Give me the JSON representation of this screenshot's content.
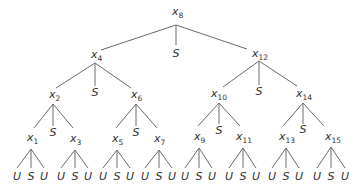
{
  "diagram": {
    "type": "ternary-search-tree",
    "line_color": "#6a6a6a",
    "text_color": "#333333",
    "nodes": [
      {
        "id": "x8",
        "var": "x",
        "sub": "8",
        "x": 172,
        "y": 15,
        "jx": 176,
        "jy": 25
      },
      {
        "id": "x4",
        "var": "x",
        "sub": "4",
        "x": 91,
        "y": 58,
        "jx": 95,
        "jy": 63
      },
      {
        "id": "x12",
        "var": "x",
        "sub": "12",
        "x": 252,
        "y": 57,
        "jx": 259,
        "jy": 61
      },
      {
        "id": "x2",
        "var": "x",
        "sub": "2",
        "x": 49,
        "y": 98,
        "jx": 53,
        "jy": 104
      },
      {
        "id": "x6",
        "var": "x",
        "sub": "6",
        "x": 131,
        "y": 98,
        "jx": 136,
        "jy": 104
      },
      {
        "id": "x10",
        "var": "x",
        "sub": "10",
        "x": 211,
        "y": 97,
        "jx": 219,
        "jy": 103
      },
      {
        "id": "x14",
        "var": "x",
        "sub": "14",
        "x": 296,
        "y": 97,
        "jx": 303,
        "jy": 103
      },
      {
        "id": "x1",
        "var": "x",
        "sub": "1",
        "x": 27,
        "y": 141,
        "jx": 31,
        "jy": 149
      },
      {
        "id": "x3",
        "var": "x",
        "sub": "3",
        "x": 70,
        "y": 142,
        "jx": 75,
        "jy": 150
      },
      {
        "id": "x5",
        "var": "x",
        "sub": "5",
        "x": 112,
        "y": 142,
        "jx": 117,
        "jy": 150
      },
      {
        "id": "x7",
        "var": "x",
        "sub": "7",
        "x": 154,
        "y": 142,
        "jx": 159,
        "jy": 150
      },
      {
        "id": "x9",
        "var": "x",
        "sub": "9",
        "x": 194,
        "y": 140,
        "jx": 199,
        "jy": 148
      },
      {
        "id": "x11",
        "var": "x",
        "sub": "11",
        "x": 236,
        "y": 140,
        "jx": 243,
        "jy": 148
      },
      {
        "id": "x13",
        "var": "x",
        "sub": "13",
        "x": 279,
        "y": 140,
        "jx": 286,
        "jy": 148
      },
      {
        "id": "x15",
        "var": "x",
        "sub": "15",
        "x": 325,
        "y": 140,
        "jx": 331,
        "jy": 147
      }
    ],
    "edges": [
      {
        "from": "x8",
        "x2": 101,
        "y2": 50
      },
      {
        "from": "x8",
        "x2": 176,
        "y2": 45
      },
      {
        "from": "x8",
        "x2": 247,
        "y2": 49
      },
      {
        "from": "x4",
        "x2": 56,
        "y2": 88
      },
      {
        "from": "x4",
        "x2": 95,
        "y2": 86
      },
      {
        "from": "x4",
        "x2": 131,
        "y2": 88
      },
      {
        "from": "x12",
        "x2": 223,
        "y2": 87
      },
      {
        "from": "x12",
        "x2": 259,
        "y2": 85
      },
      {
        "from": "x12",
        "x2": 297,
        "y2": 86
      },
      {
        "from": "x2",
        "x2": 34,
        "y2": 128
      },
      {
        "from": "x2",
        "x2": 53,
        "y2": 126
      },
      {
        "from": "x2",
        "x2": 73,
        "y2": 128
      },
      {
        "from": "x6",
        "x2": 116,
        "y2": 128
      },
      {
        "from": "x6",
        "x2": 136,
        "y2": 126
      },
      {
        "from": "x6",
        "x2": 157,
        "y2": 128
      },
      {
        "from": "x10",
        "x2": 198,
        "y2": 126
      },
      {
        "from": "x10",
        "x2": 219,
        "y2": 124
      },
      {
        "from": "x10",
        "x2": 240,
        "y2": 126
      },
      {
        "from": "x14",
        "x2": 283,
        "y2": 126
      },
      {
        "from": "x14",
        "x2": 303,
        "y2": 124
      },
      {
        "from": "x14",
        "x2": 324,
        "y2": 126
      }
    ],
    "s_labels": [
      {
        "text": "S",
        "x": 176,
        "y": 57
      },
      {
        "text": "S",
        "x": 95,
        "y": 96
      },
      {
        "text": "S",
        "x": 259,
        "y": 95
      },
      {
        "text": "S",
        "x": 53,
        "y": 136
      },
      {
        "text": "S",
        "x": 136,
        "y": 136
      },
      {
        "text": "S",
        "x": 219,
        "y": 134
      },
      {
        "text": "S",
        "x": 303,
        "y": 133
      }
    ],
    "leaf_groups": [
      {
        "parent": "x1",
        "xs": [
          17,
          31,
          44
        ]
      },
      {
        "parent": "x3",
        "xs": [
          61,
          75,
          88
        ]
      },
      {
        "parent": "x5",
        "xs": [
          103,
          117,
          130
        ]
      },
      {
        "parent": "x7",
        "xs": [
          145,
          159,
          172
        ]
      },
      {
        "parent": "x9",
        "xs": [
          185,
          199,
          212
        ]
      },
      {
        "parent": "x11",
        "xs": [
          229,
          243,
          256
        ]
      },
      {
        "parent": "x13",
        "xs": [
          272,
          286,
          299
        ]
      },
      {
        "parent": "x15",
        "xs": [
          317,
          331,
          345
        ]
      }
    ],
    "leaf_labels": [
      "U",
      "S",
      "U"
    ],
    "leaf_edge_y": 168,
    "leaf_text_y": 180
  }
}
